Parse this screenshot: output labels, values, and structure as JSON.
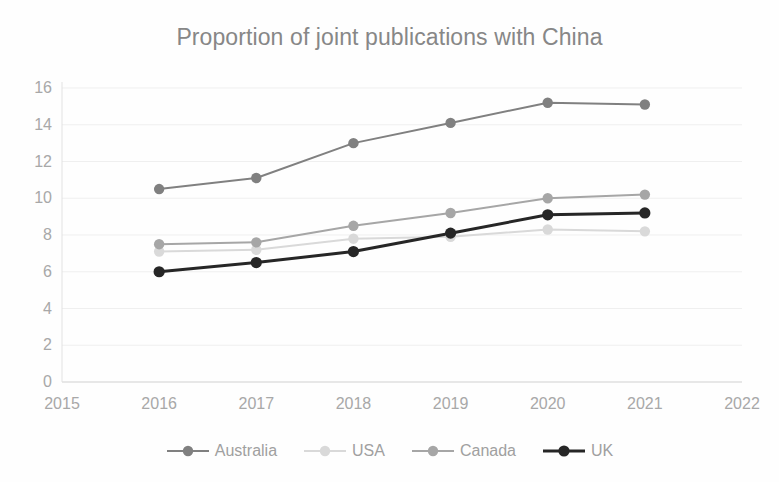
{
  "chart_data": {
    "type": "line",
    "title": "Proportion of joint publications with China",
    "xlabel": "",
    "ylabel": "",
    "x": [
      2016,
      2017,
      2018,
      2019,
      2020,
      2021
    ],
    "categories": [
      "2016",
      "2017",
      "2018",
      "2019",
      "2020",
      "2021"
    ],
    "xtick_labels": [
      "2015",
      "2016",
      "2017",
      "2018",
      "2019",
      "2020",
      "2021",
      "2022"
    ],
    "ytick_labels": [
      "0",
      "2",
      "4",
      "6",
      "8",
      "10",
      "12",
      "14",
      "16"
    ],
    "xlim": [
      2015,
      2022
    ],
    "ylim": [
      0,
      16
    ],
    "ytick_step": 2,
    "grid": true,
    "grid_axis": "y",
    "legend_position": "bottom",
    "series": [
      {
        "name": "Australia",
        "color": "#808080",
        "line_width": 2,
        "marker": "circle",
        "values": [
          10.5,
          11.1,
          13.0,
          14.1,
          15.2,
          15.1
        ]
      },
      {
        "name": "USA",
        "color": "#d9d9d9",
        "line_width": 2,
        "marker": "circle",
        "values": [
          7.1,
          7.2,
          7.8,
          7.9,
          8.3,
          8.2
        ]
      },
      {
        "name": "Canada",
        "color": "#a6a6a6",
        "line_width": 2,
        "marker": "circle",
        "values": [
          7.5,
          7.6,
          8.5,
          9.2,
          10.0,
          10.2
        ]
      },
      {
        "name": "UK",
        "color": "#262626",
        "line_width": 3,
        "marker": "circle",
        "values": [
          6.0,
          6.5,
          7.1,
          8.1,
          9.1,
          9.2
        ]
      }
    ]
  },
  "colors": {
    "background": "#fefefe",
    "title_text": "#878787",
    "tick_text": "#a8a8a8",
    "legend_text": "#a0a0a0",
    "gridline": "#efefef",
    "axis_line": "#e2e2e2"
  },
  "legend": {
    "items": [
      {
        "label": "Australia",
        "color": "#808080"
      },
      {
        "label": "USA",
        "color": "#d9d9d9"
      },
      {
        "label": "Canada",
        "color": "#a6a6a6"
      },
      {
        "label": "UK",
        "color": "#262626"
      }
    ]
  }
}
